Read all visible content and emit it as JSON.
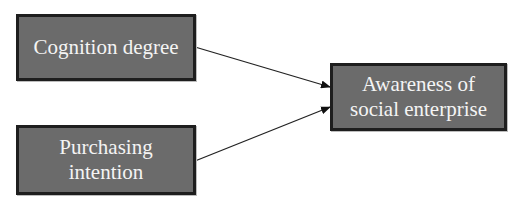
{
  "diagram": {
    "nodes": [
      {
        "id": "cognition",
        "label": "Cognition degree"
      },
      {
        "id": "purchasing",
        "label_line1": "Purchasing",
        "label_line2": "intention"
      },
      {
        "id": "awareness",
        "label_line1": "Awareness of",
        "label_line2": "social enterprise"
      }
    ],
    "edges": [
      {
        "from": "Cognition degree",
        "to": "Awareness of social enterprise"
      },
      {
        "from": "Purchasing intention",
        "to": "Awareness of social enterprise"
      }
    ],
    "colors": {
      "node_fill": "#6b6b6b",
      "node_border": "#1e1e1e",
      "node_text": "#f4f4f4",
      "edge": "#222222"
    }
  }
}
